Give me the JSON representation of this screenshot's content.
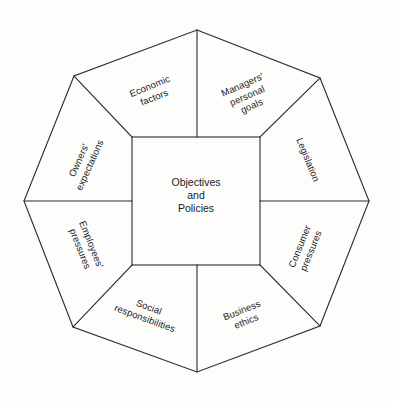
{
  "diagram": {
    "center": {
      "label": "Objectives\nand\nPolicies",
      "line1": "Objectives",
      "line2": "and",
      "line3": "Policies"
    },
    "stroke_color": "#2b2b2b",
    "background_color": "#fdfdfc",
    "text_color": "#1a1a1a",
    "sectors": [
      {
        "id": "economic-factors",
        "label": "Economic\nfactors",
        "position": "top-left",
        "rotation_deg": -22,
        "x": 152,
        "y": 92
      },
      {
        "id": "managers-personal-goals",
        "label": "Managers'\npersonal\ngoals",
        "position": "top-right",
        "rotation_deg": -24,
        "x": 247,
        "y": 95
      },
      {
        "id": "legislation",
        "label": "Legislation",
        "position": "right-upper",
        "rotation_deg": 68,
        "x": 308,
        "y": 160
      },
      {
        "id": "consumer-pressures",
        "label": "Consumer\npressures",
        "position": "right-lower",
        "rotation_deg": -68,
        "x": 305,
        "y": 249
      },
      {
        "id": "business-ethics",
        "label": "Business\nethics",
        "position": "bottom-right",
        "rotation_deg": -22,
        "x": 244,
        "y": 316
      },
      {
        "id": "social-responsibilities",
        "label": "Social\nresponsibilities",
        "position": "bottom-left",
        "rotation_deg": 20,
        "x": 147,
        "y": 313
      },
      {
        "id": "employees-pressures",
        "label": "Employees'\npressures",
        "position": "left-lower",
        "rotation_deg": 68,
        "x": 86,
        "y": 247
      },
      {
        "id": "owners-expectations",
        "label": "Owners'\nexpectations",
        "position": "left-upper",
        "rotation_deg": -66,
        "x": 84,
        "y": 163
      }
    ],
    "geometry": {
      "octagon_points": "197,30 320,78 369,201 320,326 197,372 73,327 24,201 74,76",
      "square": {
        "x": 132,
        "y": 137,
        "w": 128,
        "h": 128
      },
      "spokes": [
        {
          "id": "spoke-top",
          "x1": 197,
          "y1": 137,
          "x2": 197,
          "y2": 30
        },
        {
          "id": "spoke-top-right",
          "x1": 260,
          "y1": 137,
          "x2": 320,
          "y2": 78
        },
        {
          "id": "spoke-right",
          "x1": 260,
          "y1": 201,
          "x2": 369,
          "y2": 201
        },
        {
          "id": "spoke-bottom-right",
          "x1": 260,
          "y1": 265,
          "x2": 320,
          "y2": 326
        },
        {
          "id": "spoke-bottom",
          "x1": 197,
          "y1": 265,
          "x2": 197,
          "y2": 372
        },
        {
          "id": "spoke-bottom-left",
          "x1": 132,
          "y1": 265,
          "x2": 73,
          "y2": 327
        },
        {
          "id": "spoke-left",
          "x1": 132,
          "y1": 201,
          "x2": 24,
          "y2": 201
        },
        {
          "id": "spoke-top-left",
          "x1": 132,
          "y1": 137,
          "x2": 74,
          "y2": 76
        }
      ]
    }
  }
}
